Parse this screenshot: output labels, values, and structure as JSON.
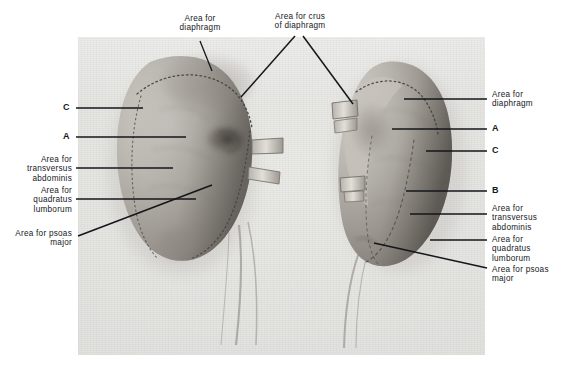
{
  "figure": {
    "plate": {
      "type": "anatomical-photograph",
      "subject": "two kidneys, posterior surfaces, with marked muscular contact areas",
      "background_color": "#e4e4e1",
      "frame_color": "#ffffff"
    },
    "specimens": [
      {
        "name": "left-kidney",
        "side": "left",
        "position": "left half of plate"
      },
      {
        "name": "right-kidney",
        "side": "right",
        "position": "right half of plate"
      }
    ]
  },
  "labels": {
    "top": [
      {
        "id": "area-for-diaphragm-top",
        "text": "Area for\ndiaphragm",
        "x": 152,
        "y": 14,
        "width": 96,
        "align": "center"
      },
      {
        "id": "area-for-crus-of-diaphragm",
        "text": "Area for crus\nof diaphragm",
        "x": 252,
        "y": 12,
        "width": 96,
        "align": "center"
      }
    ],
    "left": [
      {
        "id": "key-c-left",
        "text": "C",
        "x": 56,
        "y": 103,
        "width": 14,
        "align": "right",
        "key": true
      },
      {
        "id": "key-a-left",
        "text": "A",
        "x": 56,
        "y": 132,
        "width": 14,
        "align": "right",
        "key": true
      },
      {
        "id": "area-for-transversus-abdominis-left",
        "text": "Area for\ntransversus\nabdominis",
        "x": 6,
        "y": 155,
        "width": 66,
        "align": "right"
      },
      {
        "id": "area-for-quadratus-lumborum-left",
        "text": "Area for\nquadratus\nlumborum",
        "x": 6,
        "y": 186,
        "width": 66,
        "align": "right"
      },
      {
        "id": "area-for-psoas-major-left",
        "text": "Area for psoas\nmajor",
        "x": 2,
        "y": 229,
        "width": 70,
        "align": "right"
      }
    ],
    "right": [
      {
        "id": "area-for-diaphragm-right",
        "text": "Area for\ndiaphragm",
        "x": 492,
        "y": 90,
        "width": 66,
        "align": "left"
      },
      {
        "id": "key-a-right",
        "text": "A",
        "x": 492,
        "y": 124,
        "width": 14,
        "align": "left",
        "key": true
      },
      {
        "id": "key-c-right",
        "text": "C",
        "x": 492,
        "y": 146,
        "width": 14,
        "align": "left",
        "key": true
      },
      {
        "id": "key-b-right",
        "text": "B",
        "x": 492,
        "y": 186,
        "width": 14,
        "align": "left",
        "key": true
      },
      {
        "id": "area-for-transversus-abdominis-right",
        "text": "Area for\ntransversus\nabdominis",
        "x": 492,
        "y": 204,
        "width": 68,
        "align": "left"
      },
      {
        "id": "area-for-quadratus-lumborum-right",
        "text": "Area for\nquadratus\nlumborum",
        "x": 492,
        "y": 235,
        "width": 68,
        "align": "left"
      },
      {
        "id": "area-for-psoas-major-right",
        "text": "Area for psoas\nmajor",
        "x": 492,
        "y": 265,
        "width": 70,
        "align": "left"
      }
    ]
  },
  "leader_lines": [
    {
      "id": "leader-diaphragm-top-left",
      "points": "200,41 212,71",
      "width": 1.3
    },
    {
      "id": "leader-crus-left",
      "points": "295,36 241,97",
      "width": 1.5
    },
    {
      "id": "leader-crus-right",
      "points": "303,36 353,104",
      "width": 1.5
    },
    {
      "id": "leader-c-left",
      "points": "76,108 143,108",
      "width": 1.3
    },
    {
      "id": "leader-a-left",
      "points": "76,137 186,137",
      "width": 1.3
    },
    {
      "id": "leader-transversus-left",
      "points": "76,168 173,168",
      "width": 1.3
    },
    {
      "id": "leader-quadratus-left",
      "points": "76,199 196,199",
      "width": 1.3
    },
    {
      "id": "leader-psoas-left",
      "points": "78,236 212,185",
      "width": 1.5
    },
    {
      "id": "leader-diaphragm-right",
      "points": "487,99 404,99",
      "width": 1.3
    },
    {
      "id": "leader-a-right",
      "points": "487,129 392,129",
      "width": 1.3
    },
    {
      "id": "leader-c-right",
      "points": "487,151 426,151",
      "width": 1.3
    },
    {
      "id": "leader-b-right",
      "points": "487,191 406,191",
      "width": 1.3
    },
    {
      "id": "leader-transversus-right",
      "points": "487,214 410,214",
      "width": 1.3
    },
    {
      "id": "leader-quadratus-right",
      "points": "487,240 430,240",
      "width": 1.3
    },
    {
      "id": "leader-psoas-right",
      "points": "487,268 374,243",
      "width": 1.5
    }
  ]
}
